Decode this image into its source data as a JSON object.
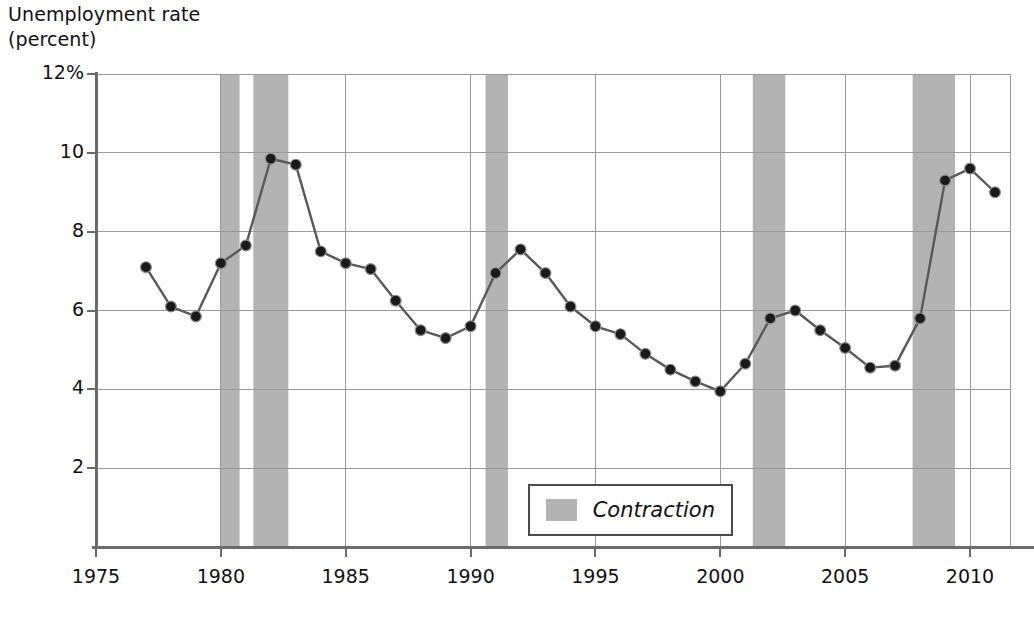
{
  "chart_data": {
    "type": "line",
    "title": "Unemployment rate\n(percent)",
    "ylabel": "Unemployment rate (percent)",
    "xlabel": "",
    "xlim": [
      1975,
      2011.6
    ],
    "ylim": [
      0,
      12
    ],
    "grid": true,
    "legend_position": "bottom-center",
    "legend": [
      {
        "label": "Contraction",
        "type": "band",
        "color": "#b3b3b3"
      }
    ],
    "y_ticks": [
      "12%",
      "10",
      "8",
      "6",
      "4",
      "2"
    ],
    "y_tick_values": [
      12,
      10,
      8,
      6,
      4,
      2
    ],
    "x_ticks": [
      "1975",
      "1980",
      "1985",
      "1990",
      "1995",
      "2000",
      "2005",
      "2010"
    ],
    "x_tick_values": [
      1975,
      1980,
      1985,
      1990,
      1995,
      2000,
      2005,
      2010
    ],
    "series": [
      {
        "name": "Unemployment rate",
        "color": "#595959",
        "marker": "circle",
        "x": [
          1977,
          1978,
          1979,
          1980,
          1981,
          1982,
          1983,
          1984,
          1985,
          1986,
          1987,
          1988,
          1989,
          1990,
          1991,
          1992,
          1993,
          1994,
          1995,
          1996,
          1997,
          1998,
          1999,
          2000,
          2001,
          2002,
          2003,
          2004,
          2005,
          2006,
          2007,
          2008,
          2009,
          2010,
          2011
        ],
        "values": [
          7.1,
          6.1,
          5.85,
          7.2,
          7.65,
          9.85,
          9.7,
          7.5,
          7.2,
          7.05,
          6.25,
          5.5,
          5.3,
          5.6,
          6.95,
          7.55,
          6.95,
          6.1,
          5.6,
          5.4,
          4.9,
          4.5,
          4.2,
          3.95,
          4.65,
          5.8,
          6.0,
          5.5,
          5.05,
          4.55,
          4.6,
          5.8,
          9.3,
          9.6,
          9.0
        ]
      }
    ],
    "bands": [
      {
        "label": "Contraction",
        "start": 1980.0,
        "end": 1980.75
      },
      {
        "label": "Contraction",
        "start": 1981.3,
        "end": 1982.7
      },
      {
        "label": "Contraction",
        "start": 1990.6,
        "end": 1991.5
      },
      {
        "label": "Contraction",
        "start": 2001.3,
        "end": 2002.6
      },
      {
        "label": "Contraction",
        "start": 2007.7,
        "end": 2009.4
      }
    ],
    "colors": {
      "band": "#b3b3b3",
      "line": "#595959",
      "marker": "#1a1a1a",
      "grid": "#9a9a9a",
      "axis": "#6b6b6b"
    }
  }
}
